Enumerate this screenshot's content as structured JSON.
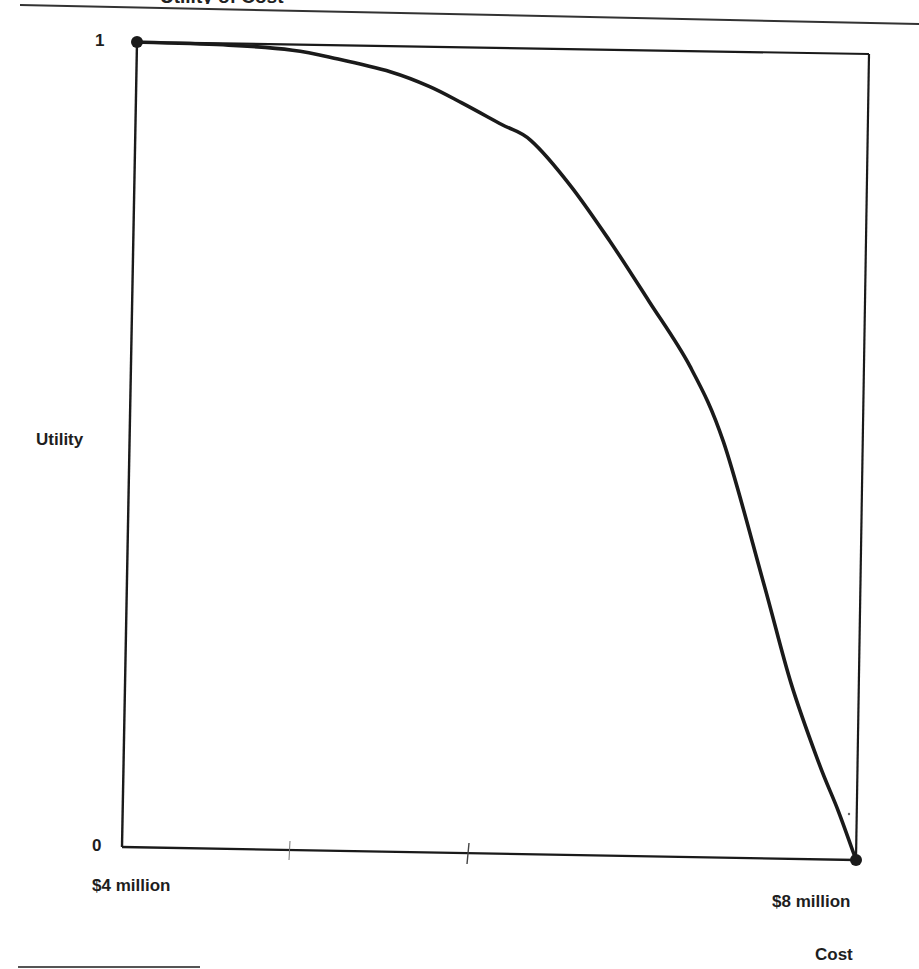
{
  "page": {
    "title_partial": "Utility of Cost"
  },
  "chart_data": {
    "type": "line",
    "title": "",
    "xlabel": "Cost",
    "ylabel": "Utility",
    "x_ticks": [
      "$4 million",
      "$8 million"
    ],
    "y_ticks": [
      "0",
      "1"
    ],
    "xlim": [
      4,
      8
    ],
    "ylim": [
      0,
      1
    ],
    "x_unit": "$ million",
    "grid": false,
    "legend": null,
    "series": [
      {
        "name": "Utility function",
        "x": [
          4.0,
          4.5,
          4.85,
          5.1,
          5.39,
          5.6,
          5.78,
          6.0,
          6.16,
          6.38,
          6.6,
          6.82,
          7.05,
          7.24,
          7.47,
          7.63,
          7.79,
          7.9,
          8.0
        ],
        "y": [
          1.0,
          0.998,
          0.993,
          0.983,
          0.968,
          0.951,
          0.931,
          0.905,
          0.886,
          0.831,
          0.763,
          0.689,
          0.609,
          0.516,
          0.343,
          0.218,
          0.119,
          0.06,
          0.0
        ]
      }
    ],
    "endpoints": [
      {
        "x": 4,
        "y": 1
      },
      {
        "x": 8,
        "y": 0
      }
    ],
    "minor_ticks_x": [
      4.9,
      5.9
    ]
  },
  "labels": {
    "y_top": "1",
    "y_bottom": "0",
    "y_axis": "Utility",
    "x_left": "$4 million",
    "x_right": "$8 million",
    "x_axis": "Cost"
  },
  "colors": {
    "ink": "#1a1a1a",
    "background": "#ffffff"
  }
}
